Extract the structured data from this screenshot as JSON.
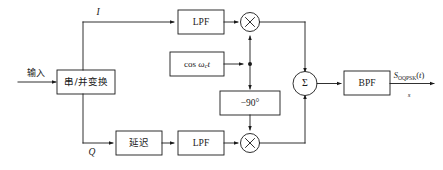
{
  "diagram": {
    "stroke_color": "#1a1a1a",
    "background_color": "#ffffff",
    "input": {
      "label": "输入"
    },
    "blocks": {
      "serial_parallel": "串/并变换",
      "lpf_upper": "LPF",
      "lpf_lower": "LPF",
      "delay": "延迟",
      "phase_shift": "−90°",
      "bpf": "BPF"
    },
    "carrier": {
      "prefix": "cos ",
      "omega": "ω",
      "subscript": "c",
      "time": "t"
    },
    "branch_labels": {
      "inphase": "I",
      "quadrature": "Q"
    },
    "summer": {
      "symbol": "Σ"
    },
    "multiplier": {
      "symbol": "×"
    },
    "output": {
      "numerator_main": "S",
      "numerator_sub": "OQPSK",
      "numerator_paren_open": "(",
      "numerator_var": "t",
      "numerator_paren_close": ")",
      "denominator": "s"
    }
  }
}
